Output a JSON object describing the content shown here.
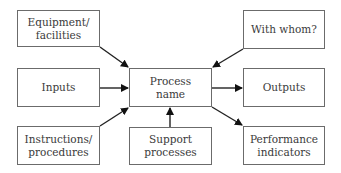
{
  "diagram": {
    "center": {
      "label": "Process name",
      "line1": "Process",
      "line2": "name"
    },
    "nodes": {
      "equipment": {
        "line1": "Equipment/",
        "line2": "facilities"
      },
      "inputs": {
        "line1": "Inputs"
      },
      "instructions": {
        "line1": "Instructions/",
        "line2": "procedures"
      },
      "support": {
        "line1": "Support",
        "line2": "processes"
      },
      "with_whom": {
        "line1": "With whom?"
      },
      "outputs": {
        "line1": "Outputs"
      },
      "performance": {
        "line1": "Performance",
        "line2": "indicators"
      }
    },
    "edges": [
      {
        "from": "Equipment/facilities",
        "to": "Process name"
      },
      {
        "from": "Inputs",
        "to": "Process name"
      },
      {
        "from": "Instructions/procedures",
        "to": "Process name"
      },
      {
        "from": "Support processes",
        "to": "Process name"
      },
      {
        "from": "With whom?",
        "to": "Process name"
      },
      {
        "from": "Process name",
        "to": "Outputs"
      },
      {
        "from": "Process name",
        "to": "Performance indicators"
      }
    ]
  }
}
